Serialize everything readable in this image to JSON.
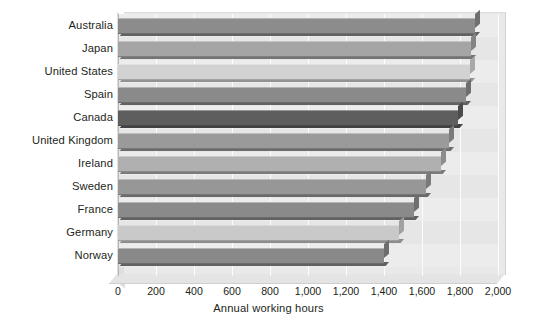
{
  "chart_data": {
    "type": "bar",
    "orientation": "horizontal",
    "title": "",
    "xlabel": "Annual working hours",
    "ylabel": "",
    "xlim": [
      0,
      2000
    ],
    "xticks": [
      "0",
      "200",
      "400",
      "600",
      "800",
      "1,000",
      "1,200",
      "1,400",
      "1,600",
      "1,800",
      "2,000"
    ],
    "xtick_values": [
      0,
      200,
      400,
      600,
      800,
      1000,
      1200,
      1400,
      1600,
      1800,
      2000
    ],
    "grid": true,
    "grid_axis": "x",
    "legend": "none",
    "style": "3d-bar",
    "categories": [
      "Australia",
      "Japan",
      "United States",
      "Spain",
      "Canada",
      "United Kingdom",
      "Ireland",
      "Sweden",
      "France",
      "Germany",
      "Norway"
    ],
    "values": [
      1880,
      1860,
      1850,
      1830,
      1790,
      1740,
      1700,
      1620,
      1560,
      1480,
      1400
    ],
    "bar_colors": [
      "#8c8c8c",
      "#a5a5a5",
      "#d2d2d2",
      "#8a8a8a",
      "#5e5e5e",
      "#9a9a9a",
      "#b0b0b0",
      "#979797",
      "#8a8a8a",
      "#c9c9c9",
      "#898989"
    ]
  },
  "colors": {
    "background": "#ffffff",
    "plot_background": "#e9e9e9",
    "gridline": "#ffffff",
    "axis": "#b6b6b6",
    "text": "#231f20"
  }
}
